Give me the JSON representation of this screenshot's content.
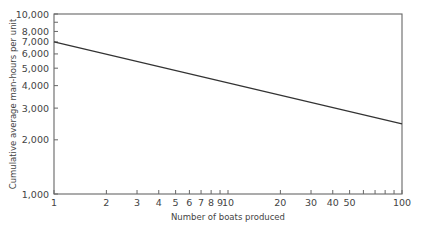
{
  "chart_data": {
    "type": "line",
    "title": "",
    "xlabel": "Number of boats produced",
    "ylabel": "Cumulative average man-hours per unit",
    "xscale": "log",
    "yscale": "log",
    "xlim": [
      1,
      100
    ],
    "ylim": [
      1000,
      10000
    ],
    "grid": false,
    "legend": null,
    "x_ticks": [
      {
        "value": 1,
        "label": "1"
      },
      {
        "value": 2,
        "label": "2"
      },
      {
        "value": 3,
        "label": "3"
      },
      {
        "value": 4,
        "label": "4"
      },
      {
        "value": 5,
        "label": "5"
      },
      {
        "value": 6,
        "label": "6"
      },
      {
        "value": 7,
        "label": "7"
      },
      {
        "value": 8,
        "label": "8"
      },
      {
        "value": 9,
        "label": "9"
      },
      {
        "value": 10,
        "label": "10"
      },
      {
        "value": 20,
        "label": "20"
      },
      {
        "value": 30,
        "label": "30"
      },
      {
        "value": 40,
        "label": "40"
      },
      {
        "value": 50,
        "label": "50"
      },
      {
        "value": 60,
        "label": ""
      },
      {
        "value": 70,
        "label": ""
      },
      {
        "value": 80,
        "label": ""
      },
      {
        "value": 90,
        "label": ""
      },
      {
        "value": 100,
        "label": "100"
      }
    ],
    "y_ticks": [
      {
        "value": 1000,
        "label": "1,000"
      },
      {
        "value": 2000,
        "label": "2,000"
      },
      {
        "value": 3000,
        "label": "3,000"
      },
      {
        "value": 4000,
        "label": "4,000"
      },
      {
        "value": 5000,
        "label": "5,000"
      },
      {
        "value": 6000,
        "label": "6,000"
      },
      {
        "value": 7000,
        "label": "7,000"
      },
      {
        "value": 8000,
        "label": "8,000"
      },
      {
        "value": 9000,
        "label": ""
      },
      {
        "value": 10000,
        "label": "10,000"
      }
    ],
    "series": [
      {
        "name": "Cumulative average man-hours",
        "x": [
          1,
          100
        ],
        "values": [
          7000,
          2450
        ]
      }
    ],
    "colors": {
      "line": "#333333",
      "frame": "#666666",
      "text": "#444444"
    }
  }
}
